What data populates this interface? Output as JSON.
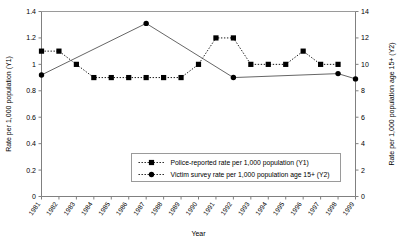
{
  "chart_data": {
    "type": "line",
    "title": "",
    "xlabel": "Year",
    "ylabel": "Rate per 1,000 population (Y1)",
    "y2label": "Rate per 1,000 population age 15+ (Y2)",
    "grid": false,
    "legend_position": "inside-bottom-center",
    "categories": [
      "1981",
      "1982",
      "1983",
      "1984",
      "1985",
      "1986",
      "1987",
      "1988",
      "1989",
      "1990",
      "1991",
      "1992",
      "1993",
      "1994",
      "1995",
      "1996",
      "1997",
      "1998",
      "1999"
    ],
    "ylim": [
      0,
      1.4
    ],
    "yticks": [
      "0",
      "0.2",
      "0.4",
      "0.6",
      "0.8",
      "1",
      "1.2",
      "1.4"
    ],
    "ytick_values": [
      0,
      0.2,
      0.4,
      0.6,
      0.8,
      1.0,
      1.2,
      1.4
    ],
    "y2lim": [
      0,
      14
    ],
    "y2ticks": [
      "0",
      "2",
      "4",
      "6",
      "8",
      "10",
      "12",
      "14"
    ],
    "y2tick_values": [
      0,
      2,
      4,
      6,
      8,
      10,
      12,
      14
    ],
    "series": [
      {
        "name": "Police-reported rate per 1,000 population (Y1)",
        "axis": "y1",
        "marker": "square",
        "linestyle": "dotted",
        "color": "#000000",
        "x": [
          "1981",
          "1982",
          "1983",
          "1984",
          "1985",
          "1986",
          "1987",
          "1988",
          "1989",
          "1990",
          "1991",
          "1992",
          "1993",
          "1994",
          "1995",
          "1996",
          "1997",
          "1998"
        ],
        "values": [
          1.1,
          1.1,
          1.0,
          0.9,
          0.9,
          0.9,
          0.9,
          0.9,
          0.9,
          1.0,
          1.2,
          1.2,
          1.0,
          1.0,
          1.0,
          1.1,
          1.0,
          1.0
        ]
      },
      {
        "name": "Victim survey rate per 1,000 population age 15+ (Y2)",
        "axis": "y2",
        "marker": "circle",
        "linestyle": "solid",
        "color": "#555555",
        "x": [
          "1981",
          "1987",
          "1992",
          "1998",
          "1999"
        ],
        "values": [
          9.2,
          13.1,
          9.0,
          9.3,
          8.9
        ]
      }
    ],
    "legend_entries": [
      {
        "label": "Police-reported rate per 1,000 population (Y1)",
        "marker": "square"
      },
      {
        "label": "Victim survey rate per 1,000 population age 15+ (Y2)",
        "marker": "circle"
      }
    ]
  }
}
